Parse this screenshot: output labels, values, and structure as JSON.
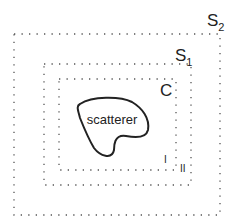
{
  "diagram": {
    "surfaces": [
      {
        "id": "S2",
        "label": "S",
        "subscript": "2"
      },
      {
        "id": "S1",
        "label": "S",
        "subscript": "1"
      },
      {
        "id": "C",
        "label": "C",
        "subscript": ""
      }
    ],
    "scatterer_label": "scatterer",
    "region_labels": [
      "I",
      "II"
    ],
    "colors": {
      "line": "#222222",
      "dots": "#555555",
      "background": "#ffffff"
    }
  }
}
